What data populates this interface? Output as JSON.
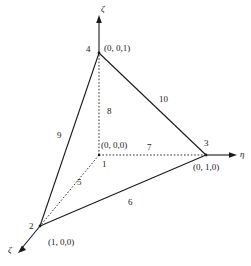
{
  "figure": {
    "title": "",
    "background_color": "#ffffff",
    "line_color": "#1a1a1a",
    "text_color": "#1a1a1a"
  },
  "axes": [
    {
      "id": "axis-zeta-vertical",
      "label": "ζ",
      "direction": "up"
    },
    {
      "id": "axis-eta",
      "label": "η",
      "direction": "right"
    },
    {
      "id": "axis-xi",
      "label": "ζ",
      "direction": "down-left"
    }
  ],
  "nodes": [
    {
      "id": "node-1",
      "number": "1",
      "coords": "(0, 0,0)"
    },
    {
      "id": "node-2",
      "number": "2",
      "coords": "(1, 0,0)"
    },
    {
      "id": "node-3",
      "number": "3",
      "coords": "(0, 1,0)"
    },
    {
      "id": "node-4",
      "number": "4",
      "coords": "(0, 0,1)"
    }
  ],
  "edges": [
    {
      "id": "edge-5",
      "number": "5",
      "style": "dashed"
    },
    {
      "id": "edge-6",
      "number": "6",
      "style": "solid"
    },
    {
      "id": "edge-7",
      "number": "7",
      "style": "dashed"
    },
    {
      "id": "edge-8",
      "number": "8",
      "style": "dashed"
    },
    {
      "id": "edge-9",
      "number": "9",
      "style": "solid"
    },
    {
      "id": "edge-10",
      "number": "10",
      "style": "solid"
    }
  ]
}
